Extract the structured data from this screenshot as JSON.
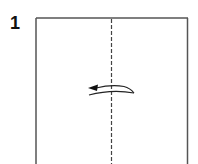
{
  "diagram": {
    "type": "origami-instruction",
    "step": {
      "number": "1",
      "instruction": "valley fold in half (right to left)"
    },
    "paper": {
      "shape": "square",
      "color": "#ffffff",
      "edge_color": "#555555"
    },
    "fold_line": {
      "style": "dashed",
      "orientation": "vertical",
      "position": "center",
      "color": "#444444"
    },
    "arrow": {
      "direction": "left",
      "style": "curved-fold-arrow",
      "color": "#222222"
    }
  }
}
